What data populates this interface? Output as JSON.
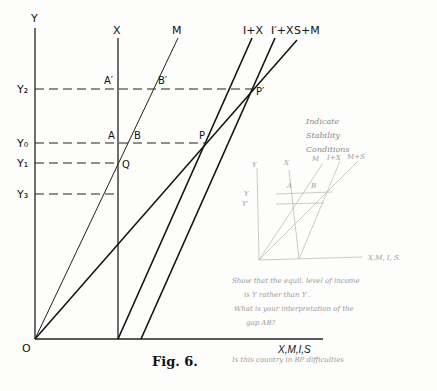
{
  "figure": {
    "caption": "Fig. 6.",
    "axes": {
      "y_label": "Y",
      "x_label": "X,M,I,S",
      "origin_label": "O"
    },
    "curve_labels": {
      "x": "X",
      "m": "M",
      "i_plus_x": "I+X",
      "i_prime_plus_x": "I′+X",
      "s_plus_m": "S+M"
    },
    "income_levels": {
      "y2": "Y₂",
      "y0": "Y₀",
      "y1": "Y₁",
      "y3": "Y₃"
    },
    "points": {
      "a_prime": "A′",
      "b_prime": "B′",
      "a": "A",
      "b": "B",
      "p": "P",
      "p_prime": "P′",
      "q": "Q"
    }
  },
  "annotations": {
    "stability_note": [
      "Indicate",
      "Stability",
      "Conditions"
    ],
    "sketch": {
      "y_axis": "Y",
      "x_line": "X",
      "m_line": "M",
      "ix_line": "I+X",
      "ms_line": "M+S",
      "level_y": "Y",
      "level_y_prime": "Y′",
      "point_a": "A",
      "point_b": "B",
      "x_axis": "X,M, I, S."
    },
    "question_1": [
      "Show that the equil. level of income",
      "is Y rather than Y′.",
      "What is your interpretation of the",
      "gap AB?"
    ],
    "question_2": "Is this country in BP difficulties"
  }
}
